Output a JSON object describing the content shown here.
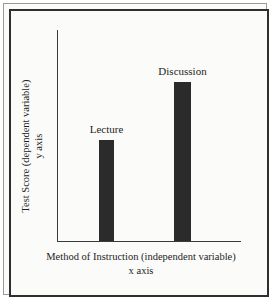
{
  "chart_data": {
    "type": "bar",
    "title": "",
    "categories": [
      "Lecture",
      "Discussion"
    ],
    "values": [
      101,
      159
    ],
    "value_unit": "relative bar height (px, unlabeled axis)",
    "xlabel": "Method of Instruction (independent variable)",
    "ylabel": "Test Score (dependent variable)",
    "xlabel_line2": "x axis",
    "ylabel_line2": "y axis",
    "grid": false,
    "legend": "none",
    "axis_ticks": "none",
    "bar_color": "#2b2b2b",
    "axis_color": "#3a3a3a",
    "background_color": "#fbfbfa",
    "frame_color": "#2f2f2f",
    "annotations": [
      {
        "text": "Lecture",
        "target": "bar-1",
        "position": "above-bar"
      },
      {
        "text": "Discussion",
        "target": "bar-2",
        "position": "above-bar"
      }
    ]
  },
  "axes": {
    "y_title_line1": "Test Score (dependent variable)",
    "y_title_line2": "y axis",
    "x_title_line1": "Method of Instruction (independent variable)",
    "x_title_line2": "x axis"
  },
  "bars": [
    {
      "label": "Lecture"
    },
    {
      "label": "Discussion"
    }
  ]
}
